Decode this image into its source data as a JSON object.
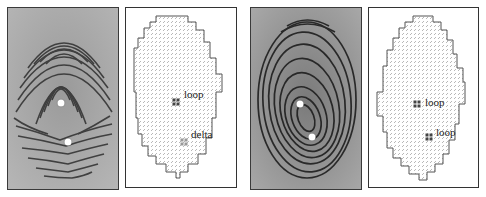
{
  "figure": {
    "panels": [
      {
        "id": "fingerprint-1",
        "type": "fingerprint-image",
        "singular_points": [
          {
            "kind": "loop",
            "x": 53,
            "y": 95
          },
          {
            "kind": "delta",
            "x": 60,
            "y": 134
          }
        ]
      },
      {
        "id": "orientation-1",
        "type": "orientation-field",
        "markers": [
          {
            "kind": "loop",
            "label": "loop",
            "x": 50,
            "y": 94,
            "label_x": 58,
            "label_y": 81
          },
          {
            "kind": "delta",
            "label": "delta",
            "x": 58,
            "y": 134,
            "label_x": 65,
            "label_y": 121
          }
        ]
      },
      {
        "id": "fingerprint-2",
        "type": "fingerprint-image",
        "singular_points": [
          {
            "kind": "loop",
            "x": 49,
            "y": 96
          },
          {
            "kind": "loop",
            "x": 61,
            "y": 129
          }
        ]
      },
      {
        "id": "orientation-2",
        "type": "orientation-field",
        "markers": [
          {
            "kind": "loop",
            "label": "loop",
            "x": 48,
            "y": 96,
            "label_x": 56,
            "label_y": 89
          },
          {
            "kind": "loop",
            "label": "loop",
            "x": 60,
            "y": 129,
            "label_x": 67,
            "label_y": 119
          }
        ]
      }
    ]
  }
}
